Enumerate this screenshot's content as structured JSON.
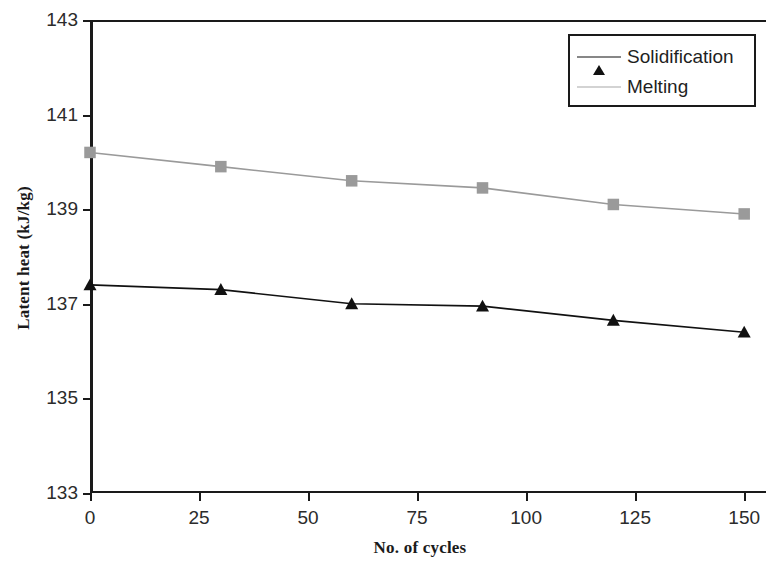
{
  "chart_data": {
    "type": "line",
    "title": "",
    "xlabel": "No. of cycles",
    "ylabel": "Latent heat (kJ/kg)",
    "x": [
      0,
      30,
      60,
      90,
      120,
      150
    ],
    "xlim": [
      0,
      155
    ],
    "ylim": [
      133,
      143
    ],
    "xticks": [
      "0",
      "25",
      "50",
      "75",
      "100",
      "125",
      "150"
    ],
    "xtick_values": [
      0,
      25,
      50,
      75,
      100,
      125,
      150
    ],
    "yticks": [
      "133",
      "135",
      "137",
      "139",
      "141",
      "143"
    ],
    "ytick_values": [
      133,
      135,
      137,
      139,
      141,
      143
    ],
    "grid": false,
    "legend_position": "top-right",
    "series": [
      {
        "name": "Solidification",
        "marker": "triangle",
        "color": "#111111",
        "values": [
          137.4,
          137.3,
          137.0,
          136.95,
          136.65,
          136.4
        ]
      },
      {
        "name": "Melting",
        "marker": "square",
        "color": "#9a9a9a",
        "values": [
          140.2,
          139.9,
          139.6,
          139.45,
          139.1,
          138.9
        ]
      }
    ]
  },
  "legend": {
    "items": [
      {
        "label": "Solidification",
        "marker": "triangle-marker",
        "color": "#111111"
      },
      {
        "label": "Melting",
        "marker": "square-marker",
        "color": "#9a9a9a"
      }
    ]
  },
  "axes": {
    "y_title": "Latent heat (kJ/kg)",
    "x_title": "No. of cycles"
  }
}
